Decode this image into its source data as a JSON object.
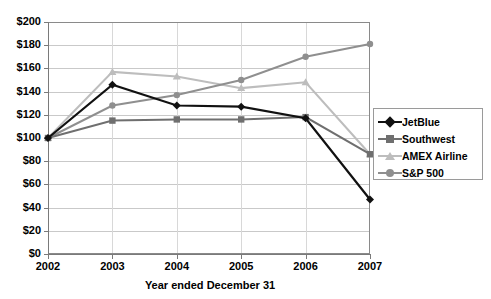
{
  "chart_data": {
    "type": "line",
    "title": "",
    "xlabel": "Year ended December 31",
    "ylabel": "",
    "x": [
      "2002",
      "2003",
      "2004",
      "2005",
      "2006",
      "2007"
    ],
    "categories": [
      "2002",
      "2003",
      "2004",
      "2005",
      "2006",
      "2007"
    ],
    "ylim": [
      0,
      200
    ],
    "ytick_labels": [
      "$0",
      "$20",
      "$40",
      "$60",
      "$80",
      "$100",
      "$120",
      "$140",
      "$160",
      "$180",
      "$200"
    ],
    "ytick_values": [
      0,
      20,
      40,
      60,
      80,
      100,
      120,
      140,
      160,
      180,
      200
    ],
    "grid": true,
    "legend_position": "right",
    "series": [
      {
        "name": "JetBlue",
        "color": "#111111",
        "marker": "diamond",
        "values": [
          100,
          146,
          128,
          127,
          117,
          47
        ]
      },
      {
        "name": "Southwest",
        "color": "#6f6f6f",
        "marker": "square",
        "values": [
          100,
          115,
          116,
          116,
          118,
          86
        ]
      },
      {
        "name": "AMEX Airline",
        "color": "#bdbdbd",
        "marker": "triangle",
        "values": [
          100,
          157,
          153,
          143,
          148,
          86
        ]
      },
      {
        "name": "S&P 500",
        "color": "#8f8f8f",
        "marker": "circle",
        "values": [
          100,
          128,
          137,
          150,
          170,
          181
        ]
      }
    ]
  },
  "legend": {
    "items": [
      {
        "label": "JetBlue"
      },
      {
        "label": "Southwest"
      },
      {
        "label": "AMEX Airline"
      },
      {
        "label": "S&P 500"
      }
    ]
  },
  "axis": {
    "x_title": "Year ended December 31"
  }
}
